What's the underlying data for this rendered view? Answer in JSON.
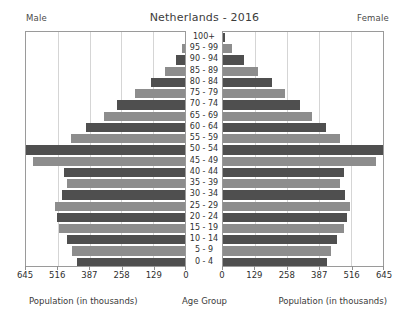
{
  "header": {
    "title": "Netherlands - 2016",
    "left_label": "Male",
    "right_label": "Female"
  },
  "footer": {
    "left_caption": "Population (in thousands)",
    "center_caption": "Age Group",
    "right_caption": "Population (in thousands)"
  },
  "colors": {
    "bar_dark": "#4f4f4f",
    "bar_light": "#8d8d8d",
    "panel_border": "#9a9a9a",
    "text": "#2f2f2f",
    "background": "#ffffff"
  },
  "chart_data": {
    "type": "bar",
    "subtype": "population-pyramid",
    "title": "Netherlands - 2016",
    "xlabel": "Population (in thousands)",
    "ylabel": "Age Group",
    "grid": true,
    "legend_position": "none",
    "orientation": "horizontal",
    "axis_direction_left": "reversed",
    "xlim": [
      0,
      645
    ],
    "xticks": [
      645,
      516,
      387,
      258,
      129,
      0
    ],
    "xticklabels": [
      "645",
      "516",
      "387",
      "258",
      "129",
      "0"
    ],
    "categories": [
      "100+",
      "95 - 99",
      "90 - 94",
      "85 - 89",
      "80 - 84",
      "75 - 79",
      "70 - 74",
      "65 - 69",
      "60 - 64",
      "55 - 59",
      "50 - 54",
      "45 - 49",
      "40 - 44",
      "35 - 39",
      "30 - 34",
      "25 - 29",
      "20 - 24",
      "15 - 19",
      "10 - 14",
      "5 - 9",
      "0 - 4"
    ],
    "series": [
      {
        "name": "Male",
        "side": "left",
        "values": [
          2,
          12,
          38,
          82,
          140,
          201,
          276,
          330,
          402,
          464,
          645,
          615,
          490,
          478,
          500,
          527,
          520,
          512,
          480,
          457,
          440
        ]
      },
      {
        "name": "Female",
        "side": "right",
        "values": [
          9,
          36,
          86,
          143,
          196,
          248,
          311,
          357,
          414,
          472,
          645,
          618,
          487,
          472,
          491,
          512,
          498,
          489,
          458,
          436,
          420
        ]
      }
    ]
  }
}
